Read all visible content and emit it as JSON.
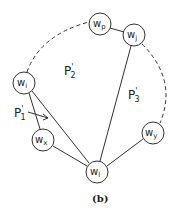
{
  "diagram": {
    "caption": "(b)",
    "nodes": [
      {
        "id": "wp",
        "base": "w",
        "sub": "p",
        "x": 100,
        "y": 24
      },
      {
        "id": "wj",
        "base": "w",
        "sub": "j",
        "x": 134,
        "y": 35
      },
      {
        "id": "wi",
        "base": "w",
        "sub": "i",
        "x": 24,
        "y": 83
      },
      {
        "id": "wx",
        "base": "w",
        "sub": "x",
        "x": 43,
        "y": 140
      },
      {
        "id": "wy",
        "base": "w",
        "sub": "y",
        "x": 153,
        "y": 133
      },
      {
        "id": "wl",
        "base": "w",
        "sub": "l",
        "x": 97,
        "y": 172
      }
    ],
    "solid_edges": [
      [
        "wp",
        "wj"
      ],
      [
        "wi",
        "wx"
      ],
      [
        "wi",
        "wl"
      ],
      [
        "wx",
        "wl"
      ],
      [
        "wj",
        "wl"
      ],
      [
        "wy",
        "wl"
      ]
    ],
    "dashed_arcs": [
      [
        "wi",
        "wp"
      ],
      [
        "wj",
        "wy"
      ]
    ],
    "regions": [
      {
        "id": "P2",
        "base": "P",
        "prime": "'",
        "sub": "2",
        "x": 70,
        "y": 75
      },
      {
        "id": "P3",
        "base": "P",
        "prime": "'",
        "sub": "3",
        "x": 130,
        "y": 100
      },
      {
        "id": "P1",
        "base": "P",
        "prime": "'",
        "sub": "1",
        "x": 16,
        "y": 117
      }
    ],
    "arrow": {
      "from": "P1",
      "label": "P1 points into region between wi-wx and wi-wl"
    }
  }
}
